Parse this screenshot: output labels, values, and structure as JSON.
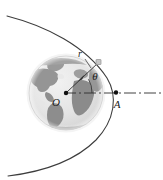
{
  "figure": {
    "background_color": "#ffffff",
    "width": 163,
    "height": 180
  },
  "labels": {
    "center": "O",
    "periapsis_point": "A",
    "radius": "r",
    "true_anomaly": "θ"
  },
  "colors": {
    "stroke": "#3d3d3d",
    "globe_ocean": "#e3e3e3",
    "globe_land": "#9a9a9a",
    "globe_land_dark": "#8a8a8a",
    "globe_edge": "#cfcfcf",
    "point_fill": "#111111",
    "satellite_fill": "#c6c6c6",
    "axis": "#2e2e2e"
  },
  "geometry": {
    "earth_center": [
      66,
      93
    ],
    "earth_radius": 37,
    "orbit_type": "hyperbolic-arc",
    "apse_point": [
      117,
      93
    ],
    "satellite_point": [
      99,
      62
    ],
    "angle_theta_degrees": 31,
    "axis_line_style": "dash-dot",
    "axis_from": [
      66,
      93
    ],
    "axis_to": [
      163,
      93
    ]
  },
  "elements": {
    "globe_name": "earth-globe",
    "trajectory_name": "orbit-trajectory-arc",
    "axis_name": "apse-line-axis",
    "radius_vector_name": "radius-vector"
  }
}
